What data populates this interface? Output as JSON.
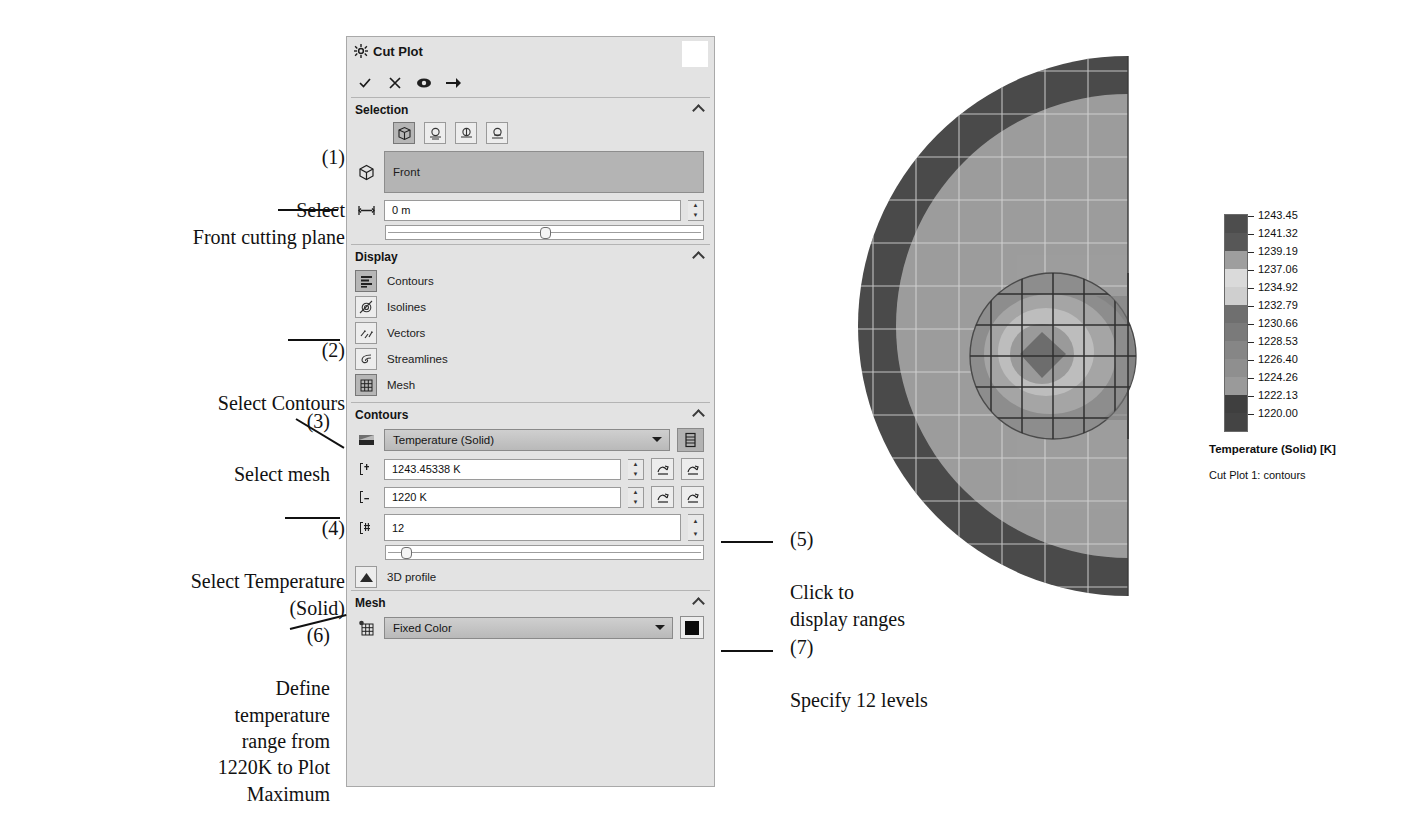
{
  "panel": {
    "title": "Cut Plot",
    "gear_icon": "gear-icon",
    "toolbar": [
      {
        "name": "ok-button",
        "glyph": "✓"
      },
      {
        "name": "cancel-button",
        "glyph": "✕"
      },
      {
        "name": "preview-eye-button",
        "glyph": "◉"
      },
      {
        "name": "pin-button",
        "glyph": "➔"
      }
    ],
    "sections": {
      "selection": {
        "title": "Selection",
        "mode_buttons": [
          "selection-mode-plane",
          "selection-mode-model-a",
          "selection-mode-model-b",
          "selection-mode-model-c"
        ],
        "reference_icon": "cube-icon",
        "reference_value": "Front",
        "offset_icon": "offset-icon",
        "offset_value": "0 m",
        "offset_slider_pct": 50
      },
      "display": {
        "title": "Display",
        "items": [
          {
            "label": "Contours",
            "icon": "contours-icon",
            "selected": true
          },
          {
            "label": "Isolines",
            "icon": "isolines-icon",
            "selected": false
          },
          {
            "label": "Vectors",
            "icon": "vectors-icon",
            "selected": false
          },
          {
            "label": "Streamlines",
            "icon": "streamlines-icon",
            "selected": false
          },
          {
            "label": "Mesh",
            "icon": "mesh-icon",
            "selected": true
          }
        ]
      },
      "contours": {
        "title": "Contours",
        "parameter_icon": "contours-icon",
        "parameter_value": "Temperature (Solid)",
        "ranges_button": "display-ranges-button",
        "max_icon": "max-value-icon",
        "max_value": "1243.45338 K",
        "min_icon": "min-value-icon",
        "min_value": "1220 K",
        "levels_icon": "levels-icon",
        "levels_value": "12",
        "levels_slider_pct": 4,
        "profile_icon": "3d-profile-icon",
        "profile_label": "3D profile"
      },
      "mesh": {
        "title": "Mesh",
        "icon": "mesh-color-icon",
        "value": "Fixed Color",
        "color": "#0b0b0b"
      }
    }
  },
  "annotations": [
    {
      "id": "1",
      "num": "(1)",
      "text": "Select\nFront cutting plane",
      "align": "right"
    },
    {
      "id": "2",
      "num": "(2)",
      "text": "Select Contours",
      "align": "right"
    },
    {
      "id": "3",
      "num": "(3)",
      "text": "Select mesh",
      "align": "right"
    },
    {
      "id": "4",
      "num": "(4)",
      "text": "Select Temperature\n(Solid)",
      "align": "right"
    },
    {
      "id": "5",
      "num": "(5)",
      "text": "Click to\ndisplay ranges",
      "align": "left"
    },
    {
      "id": "6",
      "num": "(6)",
      "text": "Define\ntemperature\nrange from\n1220K to Plot\nMaximum",
      "align": "right"
    },
    {
      "id": "7",
      "num": "(7)",
      "text": "Specify 12 levels",
      "align": "left"
    }
  ],
  "legend": {
    "caption": "Temperature (Solid) [K]",
    "subcaption": "Cut Plot 1: contours",
    "labels": [
      "1243.45",
      "1241.32",
      "1239.19",
      "1237.06",
      "1234.92",
      "1232.79",
      "1230.66",
      "1228.53",
      "1226.40",
      "1224.26",
      "1222.13",
      "1220.00"
    ],
    "band_colors": [
      "#4d4d4d",
      "#575757",
      "#9e9e9e",
      "#dadada",
      "#cfcfcf",
      "#6f6f6f",
      "#7a7a7a",
      "#868686",
      "#8f8f8f",
      "#9a9a9a",
      "#3f3f3f",
      "#444444"
    ]
  },
  "chart_data": {
    "type": "heatmap",
    "title": "Cut Plot 1: contours",
    "colorbar_label": "Temperature (Solid) [K]",
    "levels": 12,
    "vmin": 1220.0,
    "vmax": 1243.45,
    "tick_values": [
      1243.45,
      1241.32,
      1239.19,
      1237.06,
      1234.92,
      1232.79,
      1230.66,
      1228.53,
      1226.4,
      1224.26,
      1222.13,
      1220.0
    ],
    "colormap": "grayscale",
    "geometry": "half-disc cross-section with inner circular hot spot and mesh grid overlay",
    "regions": [
      {
        "name": "outer-shell",
        "value_band": "1241-1243",
        "color": "#4a4a4a"
      },
      {
        "name": "main-body",
        "value_band": "1232-1239",
        "color": "#9c9c9c"
      },
      {
        "name": "inner-circle-outer-ring",
        "value_band": "1228-1232",
        "color": "#8a8a8a"
      },
      {
        "name": "inner-circle-mid-ring",
        "value_band": "1224-1228",
        "color": "#b6b6b6"
      },
      {
        "name": "inner-core",
        "value_band": "1220-1224",
        "color": "#6d6d6d"
      }
    ]
  }
}
